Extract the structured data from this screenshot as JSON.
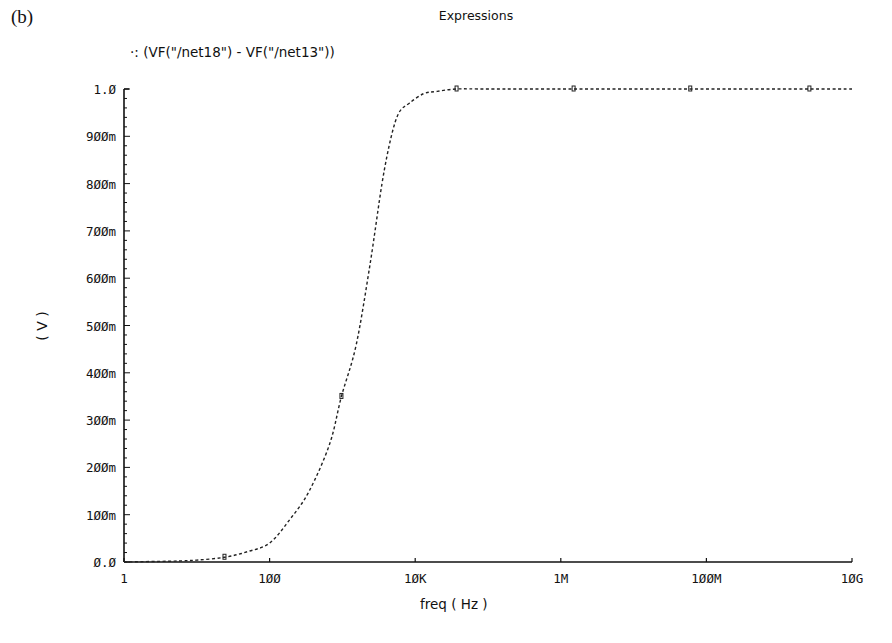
{
  "panel_label": "(b)",
  "title": "Expressions",
  "legend": {
    "marker": "‧:",
    "label": "(VF(\"/net18\") - VF(\"/net13\"))"
  },
  "ylabel": "( V )",
  "xlabel": "freq ( Hz )",
  "colors": {
    "line": "#222222",
    "axis": "#111111",
    "background": "#ffffff"
  },
  "chart_data": {
    "type": "line",
    "title": "Expressions",
    "xlabel": "freq ( Hz )",
    "ylabel": "( V )",
    "xscale": "log",
    "xlim": [
      1,
      10000000000
    ],
    "ylim": [
      0.0,
      1.0
    ],
    "grid": false,
    "legend_position": "top-left",
    "x_ticks": [
      {
        "value": 1,
        "label": "1"
      },
      {
        "value": 100,
        "label": "100"
      },
      {
        "value": 10000,
        "label": "10K"
      },
      {
        "value": 1000000,
        "label": "1M"
      },
      {
        "value": 100000000,
        "label": "100M"
      },
      {
        "value": 10000000000,
        "label": "10G"
      }
    ],
    "y_ticks": [
      {
        "value": 0.0,
        "label": "0.0"
      },
      {
        "value": 0.1,
        "label": "100m"
      },
      {
        "value": 0.2,
        "label": "200m"
      },
      {
        "value": 0.3,
        "label": "300m"
      },
      {
        "value": 0.4,
        "label": "400m"
      },
      {
        "value": 0.5,
        "label": "500m"
      },
      {
        "value": 0.6,
        "label": "600m"
      },
      {
        "value": 0.7,
        "label": "700m"
      },
      {
        "value": 0.8,
        "label": "800m"
      },
      {
        "value": 0.9,
        "label": "900m"
      },
      {
        "value": 1.0,
        "label": "1.0"
      }
    ],
    "series": [
      {
        "name": "(VF(\"/net18\") - VF(\"/net13\"))",
        "style": "dashed",
        "x": [
          1,
          5,
          10,
          24,
          50,
          100,
          190,
          350,
          670,
          970,
          1550,
          2400,
          3500,
          4700,
          6000,
          8300,
          13000,
          20000,
          37000,
          100000,
          1000000,
          10000000,
          100000000,
          1000000000,
          10000000000
        ],
        "values": [
          0.0,
          0.002,
          0.004,
          0.01,
          0.022,
          0.04,
          0.09,
          0.15,
          0.25,
          0.35,
          0.46,
          0.63,
          0.8,
          0.9,
          0.95,
          0.97,
          0.99,
          0.995,
          1.0,
          1.0,
          1.0,
          1.0,
          1.0,
          1.0,
          1.0
        ]
      }
    ],
    "markers_at": [
      24,
      970,
      37000,
      1500000,
      60000000,
      2600000000
    ]
  }
}
